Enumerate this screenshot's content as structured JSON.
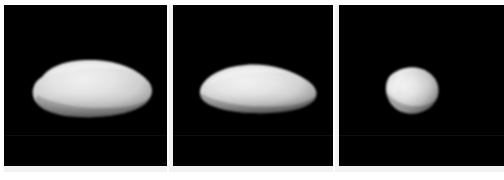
{
  "figure": {
    "type": "image-panel-series",
    "background_color": "#ffffff",
    "panel_background_color": "#000000",
    "separator_color": "#fdfdfd",
    "panel_count": 3,
    "panels": [
      {
        "id": "panel-1",
        "name": "shape-model-view-1",
        "label": "",
        "orientation": "elongated-horizontal",
        "body_fill_light": "#e6e6e6",
        "body_fill_mid": "#cfcfcf",
        "body_fill_dark": "#8f8f8f",
        "body_shadow": "#3a3a3a",
        "relative_size": "large"
      },
      {
        "id": "panel-2",
        "name": "shape-model-view-2",
        "label": "",
        "orientation": "elongated-tapered",
        "body_fill_light": "#eaeaea",
        "body_fill_mid": "#d2d2d2",
        "body_fill_dark": "#909090",
        "body_shadow": "#3a3a3a",
        "relative_size": "large"
      },
      {
        "id": "panel-3",
        "name": "shape-model-view-3",
        "label": "",
        "orientation": "compact-rounded",
        "body_fill_light": "#ededed",
        "body_fill_mid": "#cccccc",
        "body_fill_dark": "#8a8a8a",
        "body_shadow": "#353535",
        "relative_size": "small"
      }
    ]
  }
}
